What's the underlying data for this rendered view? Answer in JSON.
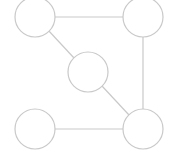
{
  "canvas": {
    "width": 170,
    "height": 154,
    "background_color": "#ffffff",
    "title": "undirected graph diagram"
  },
  "style": {
    "node_stroke_color": "#c9c9c9",
    "node_fill_color": "#ffffff",
    "node_stroke_width": 1.2,
    "edge_stroke_color": "#c9c9c9",
    "edge_stroke_width": 1.2,
    "node_radius": 20
  },
  "graph": {
    "node_count": 5,
    "edge_count": 5,
    "directed": false,
    "weighted": false,
    "labels_visible": false,
    "nodes": [
      {
        "id": "n1",
        "name": "top-left-node",
        "label": "",
        "cx": 35,
        "cy": 17,
        "r": 20
      },
      {
        "id": "n2",
        "name": "top-right-node",
        "label": "",
        "cx": 143,
        "cy": 17,
        "r": 20
      },
      {
        "id": "n3",
        "name": "center-node",
        "label": "",
        "cx": 88,
        "cy": 72,
        "r": 20
      },
      {
        "id": "n4",
        "name": "bottom-left-node",
        "label": "",
        "cx": 35,
        "cy": 129,
        "r": 20
      },
      {
        "id": "n5",
        "name": "bottom-right-node",
        "label": "",
        "cx": 143,
        "cy": 129,
        "r": 20
      }
    ],
    "edges": [
      {
        "id": "e1",
        "name": "edge-top-horizontal",
        "source": "n1",
        "target": "n2",
        "label": "",
        "x1": 55,
        "y1": 17,
        "x2": 123,
        "y2": 17
      },
      {
        "id": "e2",
        "name": "edge-right-vertical",
        "source": "n2",
        "target": "n5",
        "label": "",
        "x1": 143,
        "y1": 37,
        "x2": 143,
        "y2": 109
      },
      {
        "id": "e3",
        "name": "edge-bottom-horizontal",
        "source": "n4",
        "target": "n5",
        "label": "",
        "x1": 55,
        "y1": 129,
        "x2": 123,
        "y2": 129
      },
      {
        "id": "e4",
        "name": "edge-topleft-center",
        "source": "n1",
        "target": "n3",
        "label": "",
        "x1": 48,
        "y1": 30,
        "x2": 74,
        "y2": 58
      },
      {
        "id": "e5",
        "name": "edge-center-bottomright",
        "source": "n3",
        "target": "n5",
        "label": "",
        "x1": 102,
        "y1": 86,
        "x2": 129,
        "y2": 115
      }
    ]
  }
}
